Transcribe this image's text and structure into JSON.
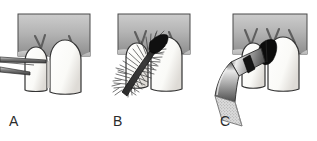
{
  "figure": {
    "kind": "dental-illustration-series",
    "background_color": "#ffffff",
    "panel_count": 3
  },
  "colors": {
    "background": "#ffffff",
    "gingiva_light": "#c9c9c9",
    "gingiva_mid": "#ababab",
    "gingiva_dark": "#8d8d8d",
    "gingiva_outline": "#4a4a4a",
    "tooth_fill": "#fdfdfb",
    "tooth_shadow": "#e2e2de",
    "tooth_outline": "#333333",
    "papilla_mark": "#5a5a5a",
    "instrument_dark": "#111111",
    "instrument_mid": "#8a8a8a",
    "instrument_light": "#d6d6d6",
    "grip_speckle": "#bdbdbd",
    "label_text": "#2b2b2b"
  },
  "panels": [
    {
      "id": "a",
      "label": "A",
      "instrument_name": "probe-blades",
      "instrument_description": "two thin flat blades entering the interdental space from the left",
      "instrument_count": 2
    },
    {
      "id": "b",
      "label": "B",
      "instrument_name": "interdental-brush",
      "instrument_description": "tapered bristle brush inserted diagonally into the interdental space",
      "instrument_count": 1
    },
    {
      "id": "c",
      "label": "C",
      "instrument_name": "applicator-syringe",
      "instrument_description": "angled applicator with dark tip delivering material into the interdental space, flared textured grip at lower end",
      "instrument_count": 1
    }
  ]
}
